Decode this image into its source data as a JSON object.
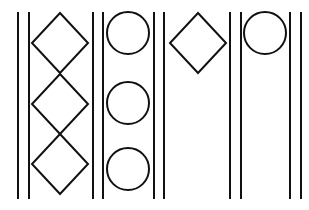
{
  "diagram": {
    "width": 309,
    "height": 210,
    "stroke_color": "#111111",
    "background": "#ffffff",
    "vertical_lines": [
      {
        "x": 18,
        "y1": 12,
        "y2": 199
      },
      {
        "x": 29,
        "y1": 12,
        "y2": 199
      },
      {
        "x": 93,
        "y1": 12,
        "y2": 199
      },
      {
        "x": 103,
        "y1": 12,
        "y2": 199
      },
      {
        "x": 154,
        "y1": 12,
        "y2": 199
      },
      {
        "x": 164,
        "y1": 12,
        "y2": 199
      },
      {
        "x": 230,
        "y1": 12,
        "y2": 199
      },
      {
        "x": 241,
        "y1": 12,
        "y2": 199
      },
      {
        "x": 290,
        "y1": 12,
        "y2": 199
      },
      {
        "x": 301,
        "y1": 12,
        "y2": 199
      }
    ],
    "columns": [
      {
        "shape": "diamond",
        "count": 3
      },
      {
        "shape": "circle",
        "count": 3
      },
      {
        "shape": "diamond",
        "count": 1
      },
      {
        "shape": "circle",
        "count": 1
      }
    ],
    "diamonds": [
      {
        "cx": 60,
        "cy": 43,
        "hw": 28,
        "hh": 30
      },
      {
        "cx": 60,
        "cy": 104,
        "hw": 28,
        "hh": 30
      },
      {
        "cx": 60,
        "cy": 164,
        "hw": 28,
        "hh": 30
      },
      {
        "cx": 198,
        "cy": 43,
        "hw": 28,
        "hh": 30
      }
    ],
    "circles": [
      {
        "cx": 128,
        "cy": 33,
        "r": 21
      },
      {
        "cx": 128,
        "cy": 103,
        "r": 21
      },
      {
        "cx": 128,
        "cy": 169,
        "r": 21
      },
      {
        "cx": 265,
        "cy": 33,
        "r": 21
      }
    ]
  }
}
